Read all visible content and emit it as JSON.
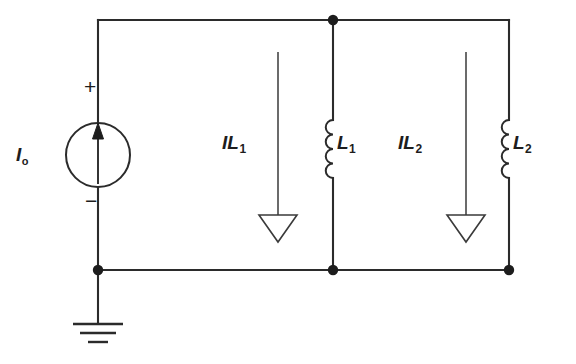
{
  "diagram": {
    "type": "electrical-circuit-schematic",
    "background_color": "#ffffff",
    "line_color": "#2b2b2b"
  },
  "labels": {
    "source": {
      "symbol": "I",
      "subscript": "o",
      "full": "Io"
    },
    "current_L1": {
      "symbol": "IL",
      "subscript": "1",
      "full": "IL1"
    },
    "inductor_L1": {
      "symbol": "L",
      "subscript": "1",
      "full": "L1"
    },
    "current_L2": {
      "symbol": "IL",
      "subscript": "2",
      "full": "IL2"
    },
    "inductor_L2": {
      "symbol": "L",
      "subscript": "2",
      "full": "L2"
    },
    "polarity_positive": "+",
    "polarity_negative": "−"
  },
  "components": {
    "current_source": {
      "name": "independent-current-source",
      "label": "Io",
      "direction": "upward",
      "terminal_positive": "top",
      "terminal_negative": "bottom"
    },
    "inductors": [
      {
        "name": "inductor-L1",
        "label": "L1",
        "branch_current": "IL1",
        "coil_turns": 4
      },
      {
        "name": "inductor-L2",
        "label": "L2",
        "branch_current": "IL2",
        "coil_turns": 4
      }
    ],
    "ground": {
      "name": "ground-symbol",
      "bars": 3
    },
    "nodes": [
      {
        "name": "node-top-mid",
        "x": 333,
        "y": 20
      },
      {
        "name": "node-bottom-left",
        "x": 98,
        "y": 270
      },
      {
        "name": "node-bottom-mid",
        "x": 333,
        "y": 270
      },
      {
        "name": "node-bottom-right",
        "x": 509,
        "y": 270
      }
    ]
  },
  "geometry": {
    "top_rail_y": 20,
    "bottom_rail_y": 270,
    "left_branch_x": 98,
    "l1_branch_x": 333,
    "l2_branch_x": 509,
    "il1_arrow_x": 278,
    "il2_arrow_x": 466,
    "source_center": {
      "x": 98,
      "y": 155
    },
    "source_radius": 32
  }
}
